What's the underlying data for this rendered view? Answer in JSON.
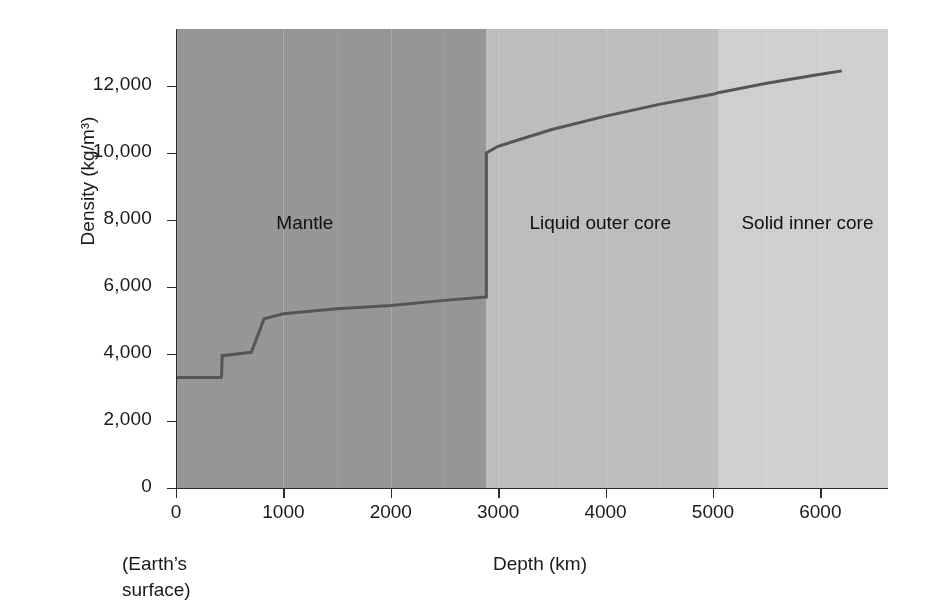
{
  "figure": {
    "axis_title_y": "Density (kg/m3)",
    "axis_title_y_display": "Density (kg/m³)",
    "axis_title_x": "Depth (km)",
    "surface_note_line1": "(Earth’s",
    "surface_note_line2": "surface)"
  },
  "regions": [
    {
      "name": "mantle",
      "label": "Mantle",
      "color": "#9b9b9b",
      "start_km": 0,
      "end_km": 2890
    },
    {
      "name": "liquid-outer-core",
      "label": "Liquid outer core",
      "color": "#c3c3c3",
      "start_km": 2890,
      "end_km": 5050
    },
    {
      "name": "solid-inner-core",
      "label": "Solid inner core",
      "color": "#d6d6d6",
      "start_km": 5050,
      "end_km": 6630
    }
  ],
  "chart_data": {
    "type": "line",
    "title": "",
    "xlabel": "Depth (km)",
    "ylabel": "Density (kg/m³)",
    "xlim": [
      0,
      6630
    ],
    "ylim": [
      0,
      13700
    ],
    "grid": false,
    "legend": null,
    "xticks": [
      0,
      1000,
      2000,
      3000,
      4000,
      5000,
      6000
    ],
    "xticklabels": [
      "0",
      "1000",
      "2000",
      "3000",
      "4000",
      "5000",
      "6000"
    ],
    "yticks": [
      0,
      2000,
      4000,
      6000,
      8000,
      10000,
      12000
    ],
    "yticklabels": [
      "0",
      "2,000",
      "4,000",
      "6,000",
      "8,000",
      "10,000",
      "12,000"
    ],
    "line_color": "#555555",
    "series": [
      {
        "name": "Earth density profile",
        "x": [
          0,
          420,
          425,
          430,
          700,
          720,
          820,
          1000,
          1500,
          2000,
          2500,
          2880,
          2890,
          2890,
          3000,
          3500,
          4000,
          4500,
          5000,
          5050,
          5500,
          6000,
          6200
        ],
        "y": [
          3300,
          3300,
          3350,
          3950,
          4050,
          4200,
          5050,
          5200,
          5350,
          5450,
          5600,
          5700,
          5700,
          10000,
          10200,
          10700,
          11100,
          11450,
          11750,
          11800,
          12080,
          12350,
          12450
        ]
      }
    ],
    "annotations": [
      {
        "text": "Mantle",
        "x_km": 1200,
        "y_density": 7900
      },
      {
        "text": "Liquid outer core",
        "x_km": 3950,
        "y_density": 7900
      },
      {
        "text": "Solid inner core",
        "x_km": 5880,
        "y_density": 7900
      }
    ],
    "notable_values": {
      "surface_density": 3300,
      "upper_mantle_step_depth_km": 425,
      "transition_zone_density": 4000,
      "lower_mantle_top_density": 5050,
      "core_mantle_boundary_depth_km": 2890,
      "core_mantle_boundary_density_below": 10000,
      "core_mantle_boundary_density_above": 5700,
      "inner_core_boundary_depth_km": 5050,
      "center_density": 12450
    }
  }
}
